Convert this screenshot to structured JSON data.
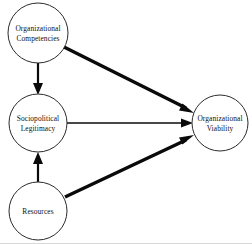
{
  "diagram": {
    "type": "path-diagram",
    "background_color": "#ffffff",
    "node_stroke_color": "#2b2b2b",
    "edge_color": "#0a0a0a",
    "text_color": "#111111",
    "nodes": [
      {
        "id": "organizational-competencies",
        "label_line1": "Organizational",
        "label_line2": "Competencies",
        "cx": 38,
        "cy": 33,
        "r": 30
      },
      {
        "id": "sociopolitical-legitimacy",
        "label_line1": "Sociopolitical",
        "label_line2": "Legitimacy",
        "cx": 38,
        "cy": 123,
        "r": 29
      },
      {
        "id": "resources",
        "label_line1": "Resources",
        "label_line2": "",
        "cx": 38,
        "cy": 211,
        "r": 29
      },
      {
        "id": "organizational-viability",
        "label_line1": "Organizational",
        "label_line2": "Viability",
        "cx": 220,
        "cy": 123,
        "r": 28
      }
    ],
    "edges": [
      {
        "id": "competencies-to-legitimacy",
        "from": "organizational-competencies",
        "to": "sociopolitical-legitimacy",
        "weight": "medium",
        "x1": 38,
        "y1": 63,
        "x2": 38,
        "y2": 92
      },
      {
        "id": "competencies-to-viability",
        "from": "organizational-competencies",
        "to": "organizational-viability",
        "weight": "thick",
        "x1": 64,
        "y1": 47,
        "x2": 190,
        "y2": 110
      },
      {
        "id": "legitimacy-to-viability",
        "from": "sociopolitical-legitimacy",
        "to": "organizational-viability",
        "weight": "thin",
        "x1": 67,
        "y1": 123,
        "x2": 190,
        "y2": 123
      },
      {
        "id": "resources-to-legitimacy",
        "from": "resources",
        "to": "sociopolitical-legitimacy",
        "weight": "medium",
        "x1": 38,
        "y1": 182,
        "x2": 38,
        "y2": 154
      },
      {
        "id": "resources-to-viability",
        "from": "resources",
        "to": "organizational-viability",
        "weight": "thick",
        "x1": 65,
        "y1": 197,
        "x2": 190,
        "y2": 138
      }
    ]
  }
}
